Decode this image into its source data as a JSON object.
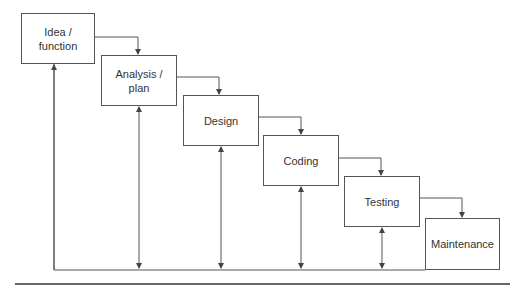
{
  "diagram": {
    "type": "waterfall-process",
    "stages": [
      {
        "id": "idea",
        "label": "Idea / function",
        "line1": "Idea /",
        "line2": "function"
      },
      {
        "id": "analysis",
        "label": "Analysis / plan",
        "line1": "Analysis /",
        "line2": "plan"
      },
      {
        "id": "design",
        "label": "Design"
      },
      {
        "id": "coding",
        "label": "Coding"
      },
      {
        "id": "testing",
        "label": "Testing"
      },
      {
        "id": "maintenance",
        "label": "Maintenance"
      }
    ],
    "colors": {
      "line": "#555555",
      "text": "#333333",
      "divider": "#333333"
    }
  }
}
